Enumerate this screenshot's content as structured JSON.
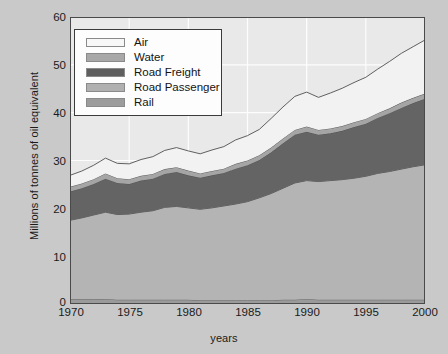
{
  "chart_data": {
    "type": "area",
    "stacked": true,
    "title": "",
    "xlabel": "years",
    "ylabel": "Millions of tonnes of oil equivalent",
    "xlim": [
      1970,
      2000
    ],
    "ylim": [
      0,
      60
    ],
    "xticks": [
      "1970",
      "1975",
      "1980",
      "1985",
      "1990",
      "1995",
      "2000"
    ],
    "yticks": [
      "0",
      "10",
      "20",
      "30",
      "40",
      "50",
      "60"
    ],
    "grid": true,
    "legend_position": "top-left-inside",
    "x": [
      1970,
      1971,
      1972,
      1973,
      1974,
      1975,
      1976,
      1977,
      1978,
      1979,
      1980,
      1981,
      1982,
      1983,
      1984,
      1985,
      1986,
      1987,
      1988,
      1989,
      1990,
      1991,
      1992,
      1993,
      1994,
      1995,
      1996,
      1997,
      1998,
      1999,
      2000
    ],
    "stack_order_bottom_to_top": [
      "Rail",
      "Road Passenger",
      "Road Freight",
      "Water",
      "Air"
    ],
    "series": [
      {
        "name": "Rail",
        "color": "#9a9a9a",
        "values": [
          1.0,
          1.0,
          1.0,
          1.0,
          0.9,
          0.9,
          0.9,
          0.9,
          0.9,
          0.9,
          0.9,
          0.8,
          0.8,
          0.8,
          0.8,
          0.8,
          0.8,
          0.8,
          0.9,
          0.9,
          1.0,
          0.9,
          0.9,
          0.9,
          0.9,
          0.9,
          0.9,
          0.9,
          0.9,
          0.9,
          0.9
        ]
      },
      {
        "name": "Road Passenger",
        "color": "#b4b4b4",
        "values": [
          16.5,
          17.0,
          17.6,
          18.2,
          17.8,
          17.9,
          18.3,
          18.6,
          19.3,
          19.5,
          19.2,
          19.0,
          19.3,
          19.7,
          20.1,
          20.6,
          21.4,
          22.3,
          23.3,
          24.4,
          24.8,
          24.7,
          24.9,
          25.1,
          25.4,
          25.8,
          26.4,
          26.8,
          27.3,
          27.8,
          28.2
        ]
      },
      {
        "name": "Road Freight",
        "color": "#646464",
        "values": [
          6.0,
          6.2,
          6.5,
          7.0,
          6.6,
          6.3,
          6.6,
          6.7,
          7.0,
          7.2,
          6.8,
          6.6,
          6.8,
          6.9,
          7.4,
          7.6,
          7.9,
          8.6,
          9.4,
          10.1,
          10.2,
          9.8,
          9.9,
          10.2,
          10.7,
          11.0,
          11.6,
          12.2,
          12.8,
          13.3,
          13.8
        ]
      },
      {
        "name": "Water",
        "color": "#a5a5a5",
        "values": [
          1.0,
          1.0,
          1.0,
          1.1,
          1.0,
          1.0,
          1.0,
          1.0,
          1.0,
          1.0,
          1.0,
          0.9,
          0.9,
          0.9,
          1.0,
          1.0,
          1.0,
          1.0,
          1.0,
          1.0,
          1.1,
          1.0,
          1.0,
          1.0,
          1.0,
          1.0,
          1.0,
          1.0,
          1.1,
          1.1,
          1.1
        ]
      },
      {
        "name": "Air",
        "color": "#f2f2f2",
        "values": [
          2.4,
          2.6,
          2.9,
          3.2,
          3.1,
          3.2,
          3.4,
          3.6,
          3.9,
          4.1,
          4.1,
          4.1,
          4.4,
          4.6,
          5.0,
          5.2,
          5.4,
          6.1,
          6.6,
          7.0,
          7.2,
          6.8,
          7.4,
          7.9,
          8.3,
          8.7,
          9.2,
          9.8,
          10.3,
          10.7,
          11.2
        ]
      }
    ],
    "totals": [
      26.9,
      27.8,
      29.0,
      30.5,
      29.4,
      29.3,
      30.2,
      30.8,
      32.1,
      32.7,
      32.0,
      31.4,
      32.2,
      32.9,
      34.3,
      35.2,
      36.5,
      38.8,
      41.2,
      43.4,
      44.3,
      43.2,
      44.1,
      45.1,
      46.3,
      47.4,
      49.1,
      50.7,
      52.4,
      53.8,
      55.2
    ]
  },
  "legend": {
    "items": [
      {
        "label": "Air",
        "color": "#f7f7f7"
      },
      {
        "label": "Water",
        "color": "#a8a8a8"
      },
      {
        "label": "Road Freight",
        "color": "#5e5e5e"
      },
      {
        "label": "Road Passenger",
        "color": "#b0b0b0"
      },
      {
        "label": "Rail",
        "color": "#9c9c9c"
      }
    ]
  },
  "axes": {
    "y_title": "Millions of tonnes of oil equivalent",
    "x_title": "years",
    "y_ticks": [
      "60",
      "50",
      "40",
      "30",
      "20",
      "10",
      "0"
    ],
    "x_ticks": [
      "1970",
      "1975",
      "1980",
      "1985",
      "1990",
      "1995",
      "2000"
    ]
  },
  "colors": {
    "background": "#c9c9c9",
    "plot_background": "#e9e9e9",
    "gridline": "#fdfdfd",
    "frame": "#4a4a4a",
    "text": "#1a1a1a"
  }
}
